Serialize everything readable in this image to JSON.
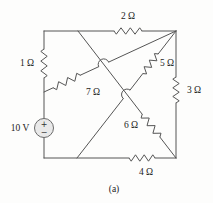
{
  "figure": {
    "caption": "(a)",
    "source": {
      "label": "10 V",
      "plus": "+",
      "minus": "−"
    },
    "resistors": {
      "r1": "1 Ω",
      "r2": "2 Ω",
      "r3": "3 Ω",
      "r4": "4 Ω",
      "r5": "5 Ω",
      "r6": "6 Ω",
      "r7": "7 Ω"
    }
  }
}
